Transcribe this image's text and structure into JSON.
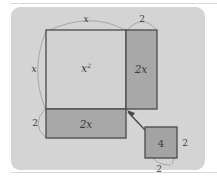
{
  "figure": {
    "panel": {
      "background_color": "#d4d4d4",
      "corner_radius": 9
    },
    "colors": {
      "square_fill": "#d2d2d2",
      "rect_fill": "#a8a8a8",
      "small_square_fill": "#a3a3a3",
      "stroke": "#4a4a4a",
      "arc_stroke": "#9a9a9a",
      "label_color": "#3a3a3a",
      "page_background": "#ffffff",
      "rule_color": "#d8d8d8"
    },
    "regions": [
      {
        "name": "big-square",
        "label": "x",
        "superscript": "2",
        "fill": "#d2d2d2",
        "meaning": "x squared"
      },
      {
        "name": "right-rectangle",
        "label": "2x",
        "fill": "#a8a8a8",
        "meaning": "two x"
      },
      {
        "name": "bottom-rectangle",
        "label": "2x",
        "fill": "#a8a8a8",
        "meaning": "two x"
      },
      {
        "name": "small-square",
        "label": "4",
        "fill": "#a3a3a3",
        "meaning": "four"
      }
    ],
    "dimension_labels": {
      "top_square_width": "x",
      "top_rect_width": "2",
      "left_square_height": "x",
      "left_rect_height": "2",
      "small_square_right": "2",
      "small_square_bottom": "2"
    },
    "callout": {
      "name": "callout-arrow",
      "from": "small-square",
      "to": "corner-junction"
    }
  }
}
